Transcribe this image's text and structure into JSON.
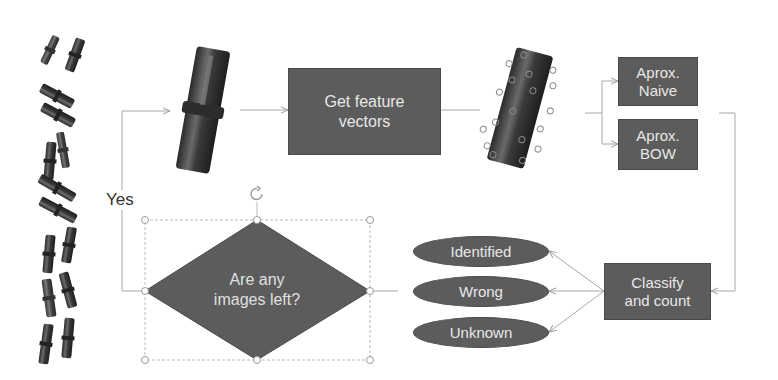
{
  "diagram": {
    "nodes": {
      "feature_box": "Get feature\nvectors",
      "naive_box": "Aprox.\nNaive",
      "bow_box": "Aprox.\nBOW",
      "classify_box": "Classify\nand count",
      "decision": "Are any\nimages left?",
      "outcomes": [
        "Identified",
        "Wrong",
        "Unknown"
      ]
    },
    "labels": {
      "yes": "Yes"
    },
    "images": {
      "input_pins": "pile-of-pins-image",
      "single_pin": "single-pin-image",
      "pin_with_features": "pin-with-keypoints-image"
    },
    "colors": {
      "box_fill": "#5c5c5c",
      "text": "#e8e8e8",
      "line": "#a8a8a8"
    }
  }
}
